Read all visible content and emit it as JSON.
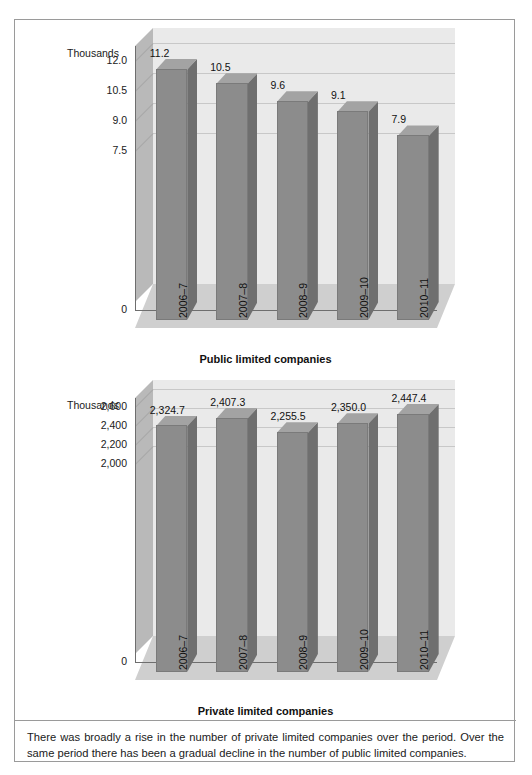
{
  "figure": {
    "caption": "There was broadly a rise in the number of private limited companies over the period. Over the same period there has been a gradual decline in the number of public limited companies."
  },
  "charts": [
    {
      "id": "chart-public",
      "title": "Public limited companies",
      "units_label": "Thousands",
      "zero_label": "0"
    },
    {
      "id": "chart-private",
      "title": "Private limited companies",
      "units_label": "Thousands",
      "zero_label": "0"
    }
  ],
  "chart_data": [
    {
      "type": "bar",
      "title": "Public limited companies",
      "xlabel": "",
      "ylabel": "Thousands",
      "categories": [
        "2006–7",
        "2007–8",
        "2008–9",
        "2009–10",
        "2010–11"
      ],
      "values": [
        11.2,
        10.5,
        9.6,
        9.1,
        7.9
      ],
      "data_labels": [
        "11.2",
        "10.5",
        "9.6",
        "9.1",
        "7.9"
      ],
      "ytick_labels": [
        "12.0",
        "10.5",
        "9.0",
        "7.5",
        "0"
      ],
      "ytick_values": [
        12.0,
        10.5,
        9.0,
        7.5,
        0
      ],
      "ylim": [
        0,
        12.75
      ],
      "grid": true,
      "legend": "none",
      "style": "3d-column"
    },
    {
      "type": "bar",
      "title": "Private limited companies",
      "xlabel": "",
      "ylabel": "Thousands",
      "categories": [
        "2006–7",
        "2007–8",
        "2008–9",
        "2009–10",
        "2010–11"
      ],
      "values": [
        2324.7,
        2407.3,
        2255.5,
        2350.0,
        2447.4
      ],
      "data_labels": [
        "2,324.7",
        "2,407.3",
        "2,255.5",
        "2,350.0",
        "2,447.4"
      ],
      "ytick_labels": [
        "2,600",
        "2,400",
        "2,200",
        "2,000",
        "0"
      ],
      "ytick_values": [
        2600,
        2400,
        2200,
        2000,
        0
      ],
      "ylim": [
        0,
        2700
      ],
      "grid": true,
      "legend": "none",
      "style": "3d-column"
    }
  ],
  "colors": {
    "bar_front": "#8c8c8c",
    "bar_side": "#6f6f6f",
    "bar_top": "#a3a3a3",
    "back_wall": "#eaeaea",
    "side_wall": "#b9b9b9",
    "floor": "#cfcfcf",
    "frame_border": "#9a9a9a",
    "text": "#1a1a1a"
  }
}
